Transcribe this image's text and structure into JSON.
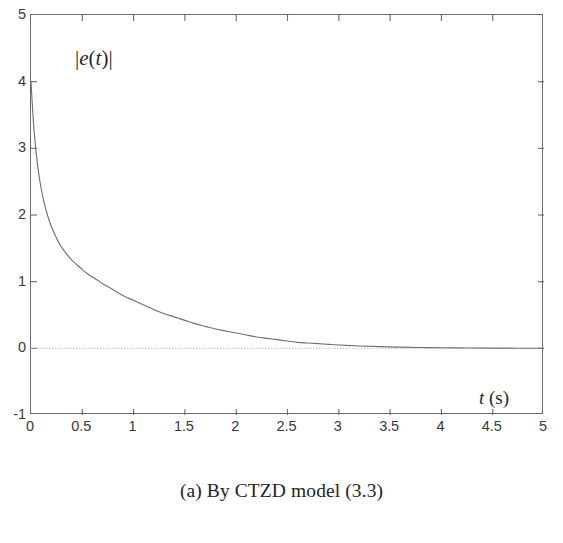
{
  "figure": {
    "caption": "(a) By CTZD model (3.3)",
    "background_color": "#ffffff",
    "line_color": "#707070",
    "axis_color": "#6a6a6a",
    "zero_line_color": "#b9b9b9",
    "text_color": "#39393b"
  },
  "labels": {
    "y_axis_bars_open": "|",
    "y_axis_e": "e",
    "y_axis_paren_open": "(",
    "y_axis_t": "t",
    "y_axis_paren_close": ")",
    "y_axis_bars_close": "|",
    "y_axis_full": "|e(t)|",
    "x_axis_t": "t",
    "x_axis_unit": "(s)",
    "x_axis_full": "t (s)"
  },
  "chart_data": {
    "type": "line",
    "title": "",
    "subtitle": "",
    "caption": "(a) By CTZD model (3.3)",
    "xlabel": "t (s)",
    "ylabel": "|e(t)|",
    "xlim": [
      0,
      5
    ],
    "ylim": [
      -1,
      5
    ],
    "grid": false,
    "legend": null,
    "xticks": [
      0,
      0.5,
      1,
      1.5,
      2,
      2.5,
      3,
      3.5,
      4,
      4.5,
      5
    ],
    "xtick_labels": [
      "0",
      "0.5",
      "1",
      "1.5",
      "2",
      "2.5",
      "3",
      "3.5",
      "4",
      "4.5",
      "5"
    ],
    "yticks": [
      -1,
      0,
      1,
      2,
      3,
      4,
      5
    ],
    "ytick_labels": [
      "-1",
      "0",
      "1",
      "2",
      "3",
      "4",
      "5"
    ],
    "annotations": [
      {
        "text": "|e(t)|",
        "x": 0.45,
        "y": 4.45
      },
      {
        "text": "t (s)",
        "x": 4.12,
        "y": -0.62
      }
    ],
    "reference_lines": [
      {
        "orientation": "horizontal",
        "y": 0,
        "style": "dotted",
        "color": "#b9b9b9"
      }
    ],
    "series": [
      {
        "name": "|e(t)|",
        "color": "#707070",
        "x": [
          0.0,
          0.02,
          0.04,
          0.06,
          0.08,
          0.1,
          0.13,
          0.16,
          0.2,
          0.24,
          0.28,
          0.32,
          0.36,
          0.4,
          0.45,
          0.5,
          0.55,
          0.6,
          0.65,
          0.7,
          0.8,
          0.9,
          1.0,
          1.1,
          1.2,
          1.3,
          1.4,
          1.5,
          1.6,
          1.7,
          1.8,
          1.9,
          2.0,
          2.1,
          2.2,
          2.3,
          2.4,
          2.5,
          2.6,
          2.7,
          2.8,
          2.9,
          3.0,
          3.2,
          3.4,
          3.6,
          3.8,
          4.0,
          4.25,
          4.5,
          4.75,
          5.0
        ],
        "y": [
          4.0,
          3.48,
          3.09,
          2.8,
          2.57,
          2.39,
          2.17,
          2.0,
          1.82,
          1.68,
          1.56,
          1.47,
          1.39,
          1.32,
          1.25,
          1.18,
          1.12,
          1.07,
          1.02,
          0.97,
          0.88,
          0.79,
          0.72,
          0.65,
          0.58,
          0.52,
          0.47,
          0.42,
          0.37,
          0.33,
          0.29,
          0.26,
          0.23,
          0.2,
          0.17,
          0.15,
          0.13,
          0.11,
          0.09,
          0.08,
          0.07,
          0.06,
          0.05,
          0.035,
          0.025,
          0.018,
          0.012,
          0.008,
          0.005,
          0.003,
          0.002,
          0.001
        ]
      }
    ]
  }
}
